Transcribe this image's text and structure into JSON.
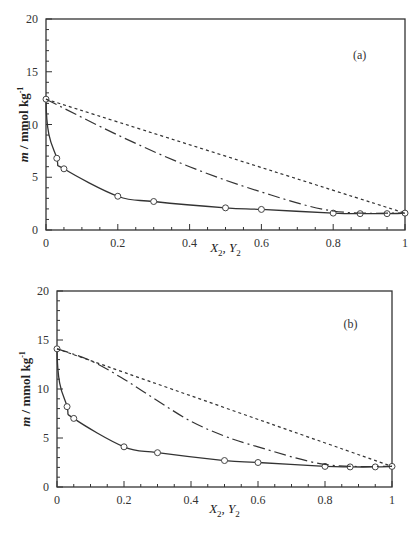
{
  "chart_data": [
    {
      "type": "line",
      "panel": "(a)",
      "title": "",
      "xlabel": "X2, Y2",
      "ylabel": "m / mmol kg-1",
      "xlim": [
        0,
        1
      ],
      "ylim": [
        0,
        20
      ],
      "xticks": [
        "0",
        "0.2",
        "0.4",
        "0.6",
        "0.8",
        "1"
      ],
      "yticks": [
        "0",
        "5",
        "10",
        "15",
        "20"
      ],
      "grid": false,
      "legend": null,
      "series": [
        {
          "name": "experimental",
          "style": "open-circle markers with solid line",
          "x": [
            0,
            0.03,
            0.05,
            0.2,
            0.3,
            0.5,
            0.6,
            0.8,
            0.875,
            0.95,
            1
          ],
          "y": [
            12.4,
            6.8,
            5.8,
            3.2,
            2.7,
            2.1,
            1.95,
            1.6,
            1.55,
            1.55,
            1.6
          ]
        },
        {
          "name": "dash-dot",
          "style": "dash-dot line",
          "x": [
            0,
            0.2,
            0.4,
            0.6,
            0.8,
            1
          ],
          "y": [
            12.4,
            9.0,
            6.0,
            3.6,
            1.8,
            1.6
          ]
        },
        {
          "name": "dotted",
          "style": "short-dash line",
          "x": [
            0,
            1
          ],
          "y": [
            12.4,
            1.6
          ]
        }
      ]
    },
    {
      "type": "line",
      "panel": "(b)",
      "title": "",
      "xlabel": "X2, Y2",
      "ylabel": "m / mmol kg-1",
      "xlim": [
        0,
        1
      ],
      "ylim": [
        0,
        20
      ],
      "xticks": [
        "0",
        "0.2",
        "0.4",
        "0.6",
        "0.8",
        "1"
      ],
      "yticks": [
        "0",
        "5",
        "10",
        "15",
        "20"
      ],
      "grid": false,
      "legend": null,
      "series": [
        {
          "name": "experimental",
          "style": "open-circle markers with solid line",
          "x": [
            0,
            0.03,
            0.05,
            0.2,
            0.3,
            0.5,
            0.6,
            0.8,
            0.875,
            0.95,
            1
          ],
          "y": [
            14.1,
            8.2,
            7.0,
            4.1,
            3.5,
            2.7,
            2.5,
            2.1,
            2.05,
            2.05,
            2.1
          ]
        },
        {
          "name": "dash-dot",
          "style": "dash-dot line",
          "x": [
            0,
            0.1,
            0.2,
            0.3,
            0.4,
            0.5,
            0.6,
            0.8,
            1
          ],
          "y": [
            14.1,
            12.9,
            11.0,
            8.8,
            6.7,
            5.2,
            4.1,
            2.3,
            2.1
          ]
        },
        {
          "name": "dotted",
          "style": "short-dash line",
          "x": [
            0,
            1
          ],
          "y": [
            14.1,
            2.1
          ]
        }
      ]
    }
  ],
  "panels": {
    "a": {
      "label": "(a)",
      "xlabel_main": "X",
      "xlabel_sub1": "2",
      "xlabel_sep": ", Y",
      "xlabel_sub2": "2",
      "ylabel_italic": "m",
      "ylabel_rest": " / mmol kg",
      "ylabel_sup": "-1"
    },
    "b": {
      "label": "(b)",
      "xlabel_main": "X",
      "xlabel_sub1": "2",
      "xlabel_sep": ", Y",
      "xlabel_sub2": "2",
      "ylabel_italic": "m",
      "ylabel_rest": " / mmol kg",
      "ylabel_sup": "-1"
    }
  }
}
